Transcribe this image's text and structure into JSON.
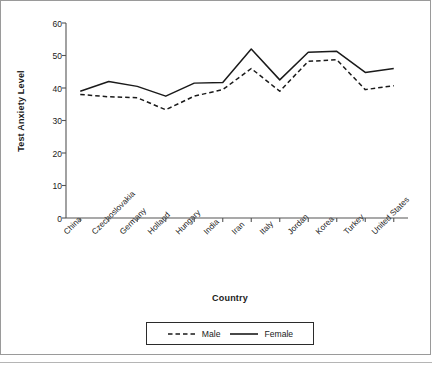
{
  "chart_data": {
    "type": "line",
    "title": "",
    "xlabel": "Country",
    "ylabel": "Test Anxiety Level",
    "categories": [
      "China",
      "Czechoslovakia",
      "Germany",
      "Holland",
      "Hungary",
      "India",
      "Iran",
      "Italy",
      "Jordan",
      "Korea",
      "Turkey",
      "United States"
    ],
    "series": [
      {
        "name": "Male",
        "style": "dashed",
        "color": "#1a1a1a",
        "values": [
          38.0,
          37.3,
          37.0,
          33.3,
          37.5,
          39.5,
          46.0,
          39.0,
          48.2,
          48.7,
          39.5,
          40.7
        ]
      },
      {
        "name": "Female",
        "style": "solid",
        "color": "#1a1a1a",
        "values": [
          39.0,
          42.0,
          40.5,
          37.5,
          41.5,
          41.7,
          52.0,
          42.5,
          51.0,
          51.3,
          44.8,
          46.0
        ]
      }
    ],
    "ylim": [
      0,
      60
    ],
    "yticks": [
      0,
      10,
      20,
      30,
      40,
      50,
      60
    ],
    "ytick_labels": [
      "0",
      "10",
      "20",
      "30",
      "40",
      "50",
      "60"
    ],
    "grid": false,
    "legend_position": "bottom-center",
    "legend_entries": [
      "Male",
      "Female"
    ]
  }
}
